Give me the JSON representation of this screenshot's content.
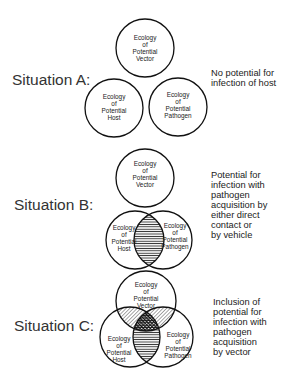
{
  "situations": [
    {
      "label": "Situation A:",
      "description": [
        "No potential for",
        "infection of host"
      ],
      "circles": {
        "vector": [
          "Ecology",
          "of",
          "Potential",
          "Vector"
        ],
        "host": [
          "Ecology",
          "of",
          "Potential",
          "Host"
        ],
        "pathogen": [
          "Ecology",
          "of",
          "Potential",
          "Pathogen"
        ]
      },
      "overlap": "none"
    },
    {
      "label": "Situation B:",
      "description": [
        "Potential for",
        "infection with",
        "pathogen",
        "acquisition by",
        "either direct",
        "contact or",
        "by vehicle"
      ],
      "circles": {
        "vector": [
          "Ecology",
          "of",
          "Potential",
          "Vector"
        ],
        "host": [
          "Ecology",
          "of",
          "Potential",
          "Host"
        ],
        "pathogen": [
          "Ecology",
          "of",
          "Potential",
          "Pathogen"
        ]
      },
      "overlap": "host-pathogen"
    },
    {
      "label": "Situation C:",
      "description": [
        "Inclusion of",
        "potential for",
        "infection with",
        "pathogen",
        "acquisition",
        "by vector"
      ],
      "circles": {
        "vector": [
          "Ecology",
          "of",
          "Potential",
          "Vector"
        ],
        "host": [
          "Ecology",
          "of",
          "Potential",
          "Host"
        ],
        "pathogen": [
          "Ecology",
          "of",
          "Potential",
          "Pathogen"
        ]
      },
      "overlap": "all-three"
    }
  ],
  "colors": {
    "stroke": "#111111",
    "hatch": "#222222",
    "background": "#ffffff"
  }
}
